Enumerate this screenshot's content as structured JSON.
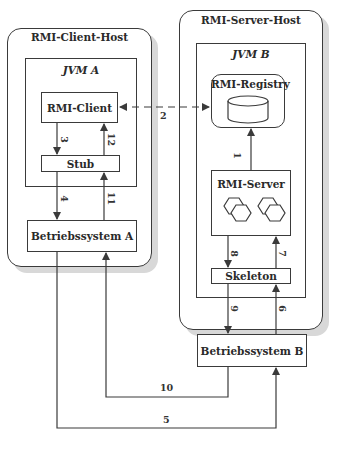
{
  "client_host": {
    "title": "RMI-Client-Host",
    "jvm": "JVM A",
    "rmi_client": "RMI-Client",
    "stub": "Stub",
    "os": "Betriebssystem A"
  },
  "server_host": {
    "title": "RMI-Server-Host",
    "jvm": "JVM B",
    "registry": "RMI-Registry",
    "rmi_server": "RMI-Server",
    "skeleton": "Skeleton",
    "os": "Betriebssystem B"
  },
  "steps": {
    "s1": "1",
    "s2": "2",
    "s3": "3",
    "s4": "4",
    "s5": "5",
    "s6": "6",
    "s7": "7",
    "s8": "8",
    "s9": "9",
    "s10": "10",
    "s11": "11",
    "s12": "12"
  },
  "colors": {
    "line": "#3a3a3a",
    "shadow": "#d8d8d8"
  }
}
